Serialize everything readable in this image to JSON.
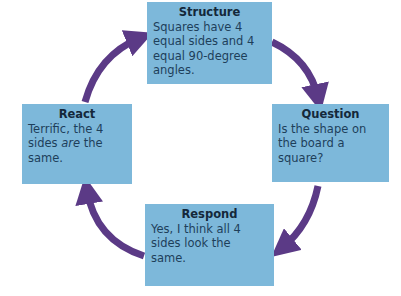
{
  "diagram": {
    "type": "cycle",
    "colors": {
      "box_fill": "#7db8da",
      "arrow": "#5b3a86",
      "text": "#1e3f5a"
    },
    "nodes": [
      {
        "id": "structure",
        "title": "Structure",
        "text": "Squares have 4 equal sides and 4 equal 90-degree angles."
      },
      {
        "id": "question",
        "title": "Question",
        "text": "Is the shape on the board a square?"
      },
      {
        "id": "respond",
        "title": "Respond",
        "text": "Yes, I think all 4 sides look the same."
      },
      {
        "id": "react",
        "title": "React",
        "text_before": "Terrific, the 4 sides ",
        "text_emphasis": "are",
        "text_after": " the same."
      }
    ],
    "edges": [
      {
        "from": "structure",
        "to": "question"
      },
      {
        "from": "question",
        "to": "respond"
      },
      {
        "from": "respond",
        "to": "react"
      },
      {
        "from": "react",
        "to": "structure"
      }
    ]
  }
}
